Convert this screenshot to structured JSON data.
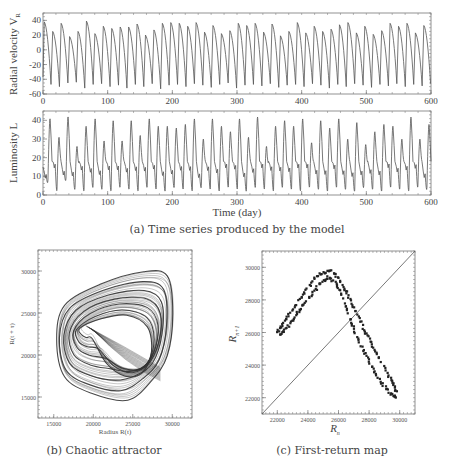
{
  "chart_data": [
    {
      "id": "a_top",
      "type": "line",
      "title": "",
      "xlabel": "",
      "ylabel": "Radial velocity V_R",
      "xlim": [
        0,
        600
      ],
      "ylim": [
        -60,
        50
      ],
      "xticks": [
        0,
        100,
        200,
        300,
        400,
        500,
        600
      ],
      "yticks": [
        -60,
        -40,
        -20,
        0,
        20,
        40
      ],
      "grid": false,
      "series": [
        {
          "name": "Radial velocity",
          "peaks": [
            38,
            25,
            36,
            18,
            25,
            39,
            22,
            32,
            29,
            31,
            31,
            35,
            20,
            27,
            36,
            37,
            36,
            32,
            37,
            24,
            33,
            22,
            26,
            36,
            33,
            36,
            24,
            35,
            19,
            25,
            37,
            23,
            32,
            25,
            28,
            34,
            37,
            23,
            32,
            21,
            26,
            36,
            32,
            36,
            23,
            33
          ],
          "troughs": [
            -47,
            -50,
            -45,
            -44,
            -52,
            -47,
            -46,
            -50,
            -48,
            -52,
            -47,
            -50,
            -46,
            -53,
            -48,
            -47,
            -50,
            -46,
            -48,
            -51,
            -47,
            -45,
            -52,
            -48,
            -47,
            -49,
            -46,
            -51,
            -48,
            -47,
            -50,
            -46,
            -48,
            -52,
            -47,
            -50,
            -46,
            -48,
            -51,
            -47,
            -49,
            -46,
            -50,
            -47,
            -49,
            -46
          ],
          "approx_period_days": 12.7
        }
      ]
    },
    {
      "id": "a_bottom",
      "type": "line",
      "title": "",
      "xlabel": "Time (day)",
      "ylabel": "Luminosity L",
      "xlim": [
        0,
        600
      ],
      "ylim": [
        0,
        45
      ],
      "xticks": [
        0,
        100,
        200,
        300,
        400,
        500,
        600
      ],
      "yticks": [
        0,
        10,
        20,
        30,
        40
      ],
      "grid": false,
      "series": [
        {
          "name": "Luminosity",
          "peaks": [
            40,
            30,
            41,
            25,
            36,
            40,
            28,
            39,
            28,
            39,
            31,
            40,
            36,
            36,
            35,
            37,
            40,
            29,
            40,
            36,
            33,
            40,
            30,
            41,
            25,
            36,
            39,
            36,
            40,
            27,
            39,
            35,
            40,
            29,
            38,
            26,
            33,
            37,
            36,
            29,
            41,
            29,
            37
          ],
          "troughs": [
            8,
            3,
            9,
            4,
            3,
            5,
            4,
            3,
            5,
            4,
            3,
            5,
            4,
            3,
            5,
            4,
            3,
            5,
            4,
            3,
            5,
            4,
            3,
            5,
            4,
            3,
            5,
            4,
            3,
            5,
            4,
            3,
            5,
            4,
            3,
            5,
            4,
            3,
            5,
            4,
            3,
            5,
            4
          ],
          "approx_period_days": 13.5
        }
      ]
    },
    {
      "id": "b",
      "type": "line",
      "title": "",
      "xlabel": "Radius R(t)",
      "ylabel": "R(t+τ)",
      "xlim": [
        13000,
        32500
      ],
      "ylim": [
        12500,
        32500
      ],
      "xticks": [
        15000,
        20000,
        25000,
        30000
      ],
      "yticks": [
        15000,
        20000,
        25000,
        30000
      ],
      "grid": false,
      "description": "Delay-embedding phase portrait: dense bundle of closed orbits forming a rounded triangular chaotic attractor spanning x≈15000-30000, y≈14500-30000",
      "series": [
        {
          "name": "outer loop",
          "points": [
            [
              15500,
              22000
            ],
            [
              16500,
              26000
            ],
            [
              21000,
              28500
            ],
            [
              26500,
              30000
            ],
            [
              29500,
              29500
            ],
            [
              30200,
              25000
            ],
            [
              29500,
              20000
            ],
            [
              27500,
              17000
            ],
            [
              24500,
              14700
            ],
            [
              20000,
              15500
            ],
            [
              16500,
              17500
            ],
            [
              15500,
              22000
            ]
          ]
        },
        {
          "name": "inner loop",
          "points": [
            [
              19000,
              23500
            ],
            [
              22000,
              24000
            ],
            [
              25000,
              24000
            ],
            [
              27000,
              22000
            ],
            [
              27000,
              18500
            ],
            [
              25500,
              16500
            ],
            [
              23000,
              17000
            ],
            [
              20500,
              19500
            ],
            [
              19000,
              23500
            ]
          ]
        }
      ]
    },
    {
      "id": "c",
      "type": "scatter",
      "title": "",
      "xlabel": "R_n",
      "ylabel": "R_{n+1}",
      "xlim": [
        21000,
        31000
      ],
      "ylim": [
        21000,
        31000
      ],
      "xticks": [
        22000,
        24000,
        26000,
        28000,
        30000
      ],
      "yticks": [
        22000,
        24000,
        26000,
        28000,
        30000
      ],
      "grid": false,
      "diagonal": {
        "from": [
          21000,
          21000
        ],
        "to": [
          31000,
          31000
        ]
      },
      "series": [
        {
          "name": "upper branch",
          "points": [
            [
              22000,
              26000
            ],
            [
              22300,
              26400
            ],
            [
              22700,
              27000
            ],
            [
              23200,
              27700
            ],
            [
              23800,
              28500
            ],
            [
              24400,
              29300
            ],
            [
              25000,
              29700
            ],
            [
              25500,
              29800
            ],
            [
              26000,
              29300
            ],
            [
              26500,
              28500
            ],
            [
              27000,
              27500
            ],
            [
              27500,
              26500
            ],
            [
              28000,
              25600
            ],
            [
              28500,
              24700
            ],
            [
              29000,
              23800
            ],
            [
              29500,
              23000
            ],
            [
              29800,
              22300
            ]
          ]
        },
        {
          "name": "lower branch",
          "points": [
            [
              22200,
              25900
            ],
            [
              22600,
              26300
            ],
            [
              23100,
              26900
            ],
            [
              23600,
              27600
            ],
            [
              24200,
              28300
            ],
            [
              24800,
              29000
            ],
            [
              25300,
              29400
            ],
            [
              25900,
              29000
            ],
            [
              26300,
              28000
            ],
            [
              26700,
              27000
            ],
            [
              27100,
              26000
            ],
            [
              27600,
              25000
            ],
            [
              28100,
              24000
            ],
            [
              28600,
              23200
            ],
            [
              29100,
              22600
            ],
            [
              29600,
              22100
            ],
            [
              29800,
              22000
            ]
          ]
        }
      ]
    }
  ],
  "panels": {
    "a": {
      "top_ylabel": "Radial velocity V",
      "top_ylabel_sub": "R",
      "bottom_ylabel": "Luminosity L",
      "xlabel": "Time (day)",
      "caption": "(a) Time series produced by the model"
    },
    "b": {
      "xlabel": "Radius R(t)",
      "ylabel": "R(t + τ)",
      "caption": "(b) Chaotic attractor"
    },
    "c": {
      "xlabel": "R",
      "xlabel_sub": "n",
      "ylabel": "R",
      "ylabel_sub": "n+1",
      "caption": "(c) First-return map"
    }
  },
  "colors": {
    "line": "#555555",
    "frame": "#777777",
    "points": "#222222",
    "attractor": "#333333"
  }
}
